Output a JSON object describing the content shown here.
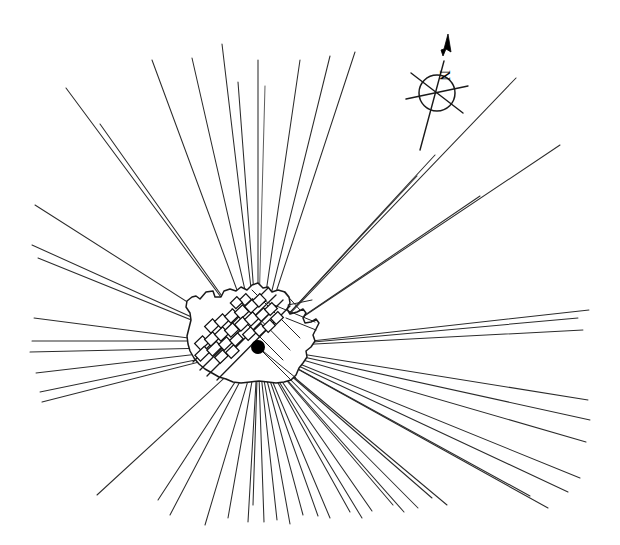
{
  "figure": {
    "kind": "historic-town-road-network-map",
    "background_color": "#ffffff",
    "ink_color": "#1a1a1a",
    "width": 620,
    "height": 545
  },
  "compass": {
    "name": "compass-rose",
    "north_label": "N",
    "center_x": 437,
    "center_y": 93,
    "radius": 18,
    "bearing_degrees": 8,
    "label_rotation_degrees": 90
  },
  "town": {
    "name": "town-settlement",
    "outline_label": "town boundary",
    "landmark": {
      "name": "central-landmark",
      "label": "",
      "x": 258,
      "y": 347,
      "radius": 7,
      "color": "#000000"
    },
    "outline_points": "200,299 206,292 213,291 215,297 221,297 224,291 230,289 236,291 241,287 247,290 252,285 258,283 263,288 268,287 272,292 278,290 285,292 289,297 290,303 287,309 290,314 297,312 303,309 306,313 303,318 305,323 311,322 316,319 319,323 316,329 313,335 315,341 311,347 306,351 307,357 303,363 299,368 296,375 291,380 284,382 276,383 268,382 259,381 250,382 241,383 233,382 226,379 219,377 212,373 205,369 199,364 194,358 190,351 188,344 187,336 189,328 191,320 190,313 186,307 187,301 192,297 196,296"
  },
  "streets": {
    "name": "street-network",
    "main_axis_label": "main street axis",
    "count_visible": 9
  },
  "blocks": {
    "name": "building-blocks",
    "description": "small rectangular urban blocks lining the main streets",
    "count": 26
  },
  "rays": {
    "name": "radial-roads",
    "description": "long straight roads radiating outward from the town",
    "origin_x": 258,
    "origin_y": 347,
    "count": 44,
    "endpoints": [
      [
        35,
        205
      ],
      [
        32,
        245
      ],
      [
        38,
        258
      ],
      [
        34,
        318
      ],
      [
        30,
        352
      ],
      [
        36,
        373
      ],
      [
        40,
        392
      ],
      [
        42,
        402
      ],
      [
        97,
        495
      ],
      [
        158,
        500
      ],
      [
        170,
        515
      ],
      [
        205,
        525
      ],
      [
        228,
        518
      ],
      [
        248,
        522
      ],
      [
        253,
        505
      ],
      [
        264,
        522
      ],
      [
        277,
        520
      ],
      [
        290,
        524
      ],
      [
        303,
        515
      ],
      [
        318,
        516
      ],
      [
        330,
        518
      ],
      [
        350,
        512
      ],
      [
        362,
        518
      ],
      [
        372,
        511
      ],
      [
        393,
        505
      ],
      [
        404,
        512
      ],
      [
        418,
        508
      ],
      [
        432,
        498
      ],
      [
        447,
        505
      ],
      [
        530,
        496
      ],
      [
        548,
        508
      ],
      [
        568,
        492
      ],
      [
        580,
        478
      ],
      [
        586,
        442
      ],
      [
        590,
        420
      ],
      [
        588,
        400
      ],
      [
        583,
        330
      ],
      [
        589,
        310
      ],
      [
        578,
        318
      ],
      [
        560,
        145
      ],
      [
        516,
        78
      ],
      [
        480,
        196
      ],
      [
        435,
        155
      ],
      [
        417,
        176
      ],
      [
        355,
        52
      ],
      [
        330,
        56
      ],
      [
        300,
        60
      ],
      [
        268,
        86
      ],
      [
        258,
        60
      ],
      [
        222,
        44
      ],
      [
        192,
        58
      ],
      [
        152,
        60
      ],
      [
        100,
        124
      ],
      [
        66,
        88
      ]
    ]
  }
}
